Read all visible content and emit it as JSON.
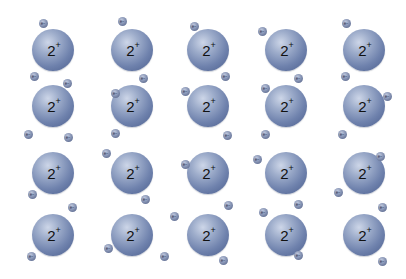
{
  "diagram": {
    "type": "metallic-bonding-lattice",
    "ion_label": "2",
    "ion_charge_sign": "+",
    "electron_label": "e-",
    "colors": {
      "ion": "#6f82ad",
      "electron": "#8895b5",
      "background": "#ffffff"
    },
    "ion_radius": 21,
    "ion_columns_x": [
      53,
      132,
      208,
      286,
      364
    ],
    "ion_rows_y": [
      50,
      106,
      173,
      235
    ],
    "electrons": [
      [
        43,
        23
      ],
      [
        122,
        21
      ],
      [
        194,
        26
      ],
      [
        262,
        31
      ],
      [
        346,
        23
      ],
      [
        34,
        76
      ],
      [
        67,
        83
      ],
      [
        143,
        78
      ],
      [
        115,
        93
      ],
      [
        225,
        76
      ],
      [
        185,
        91
      ],
      [
        298,
        78
      ],
      [
        265,
        88
      ],
      [
        345,
        76
      ],
      [
        387,
        96
      ],
      [
        28,
        134
      ],
      [
        68,
        137
      ],
      [
        115,
        133
      ],
      [
        227,
        135
      ],
      [
        265,
        134
      ],
      [
        342,
        134
      ],
      [
        106,
        153
      ],
      [
        185,
        164
      ],
      [
        257,
        159
      ],
      [
        380,
        156
      ],
      [
        32,
        194
      ],
      [
        145,
        199
      ],
      [
        72,
        207
      ],
      [
        338,
        192
      ],
      [
        228,
        205
      ],
      [
        298,
        204
      ],
      [
        263,
        212
      ],
      [
        174,
        216
      ],
      [
        382,
        207
      ],
      [
        31,
        256
      ],
      [
        108,
        248
      ],
      [
        164,
        256
      ],
      [
        223,
        260
      ],
      [
        298,
        255
      ],
      [
        382,
        261
      ]
    ]
  }
}
